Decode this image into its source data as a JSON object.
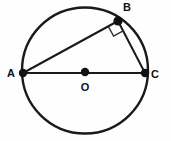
{
  "figure": {
    "type": "geometry-diagram",
    "background_color": "#fefefe",
    "stroke_color": "#1a1a1a",
    "width": 171,
    "height": 141,
    "circle": {
      "name": "circle",
      "cx": 85,
      "cy": 70.5,
      "r": 63,
      "stroke_width": 2.4
    },
    "points": [
      {
        "id": "A",
        "label": "A",
        "x": 23,
        "y": 73,
        "label_x": 11,
        "label_y": 77,
        "dot_r": 4.2
      },
      {
        "id": "B",
        "label": "B",
        "x": 118,
        "y": 21,
        "label_x": 127,
        "label_y": 11,
        "dot_r": 4.6
      },
      {
        "id": "C",
        "label": "C",
        "x": 145,
        "y": 73,
        "label_x": 155,
        "label_y": 78,
        "dot_r": 4.2
      },
      {
        "id": "O",
        "label": "O",
        "x": 85,
        "y": 72,
        "label_x": 85,
        "label_y": 91,
        "dot_r": 4.2
      }
    ],
    "segments": [
      {
        "id": "AC",
        "name": "diameter-ac",
        "x1": 23,
        "y1": 73,
        "x2": 145,
        "y2": 73,
        "stroke_width": 2.2
      },
      {
        "id": "AB",
        "name": "chord-ab",
        "x1": 23,
        "y1": 73,
        "x2": 118,
        "y2": 21,
        "stroke_width": 2.0
      },
      {
        "id": "BC",
        "name": "chord-bc",
        "x1": 118,
        "y1": 21,
        "x2": 145,
        "y2": 73,
        "stroke_width": 2.0
      }
    ],
    "right_angle": {
      "name": "right-angle-marker-at-b",
      "at_point": "B",
      "size": 13,
      "stroke_width": 1.3,
      "points": "108.4,26.6 113.6,36.1 123.1,30.9"
    },
    "labels": {
      "A": "A",
      "B": "B",
      "C": "C",
      "O": "O"
    }
  }
}
